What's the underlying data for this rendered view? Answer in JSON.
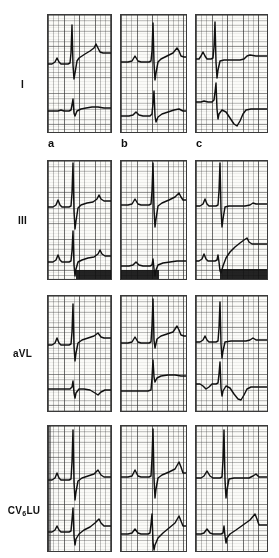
{
  "figure": {
    "type": "ecg-strip-grid",
    "rows": 4,
    "columns": 3,
    "background_color": "#ffffff",
    "trace_color": "#101010",
    "grid_color": "#4a4a4a",
    "paper_color": "#fbfbf8"
  },
  "row_labels": [
    {
      "id": "lead-I",
      "text": "I",
      "sub": ""
    },
    {
      "id": "lead-III",
      "text": "III",
      "sub": ""
    },
    {
      "id": "lead-aVL",
      "text": "aVL",
      "sub": ""
    },
    {
      "id": "lead-CV6LU",
      "text": "CV",
      "sub": "6",
      "suffix": "LU"
    }
  ],
  "column_letters": [
    {
      "id": "col-a",
      "text": "a"
    },
    {
      "id": "col-b",
      "text": "b"
    },
    {
      "id": "col-c",
      "text": "c"
    }
  ],
  "panels": [
    {
      "id": "panel-I-a",
      "lead": "I",
      "column": "a",
      "traces": 2,
      "features": "upper trace: small P wave, tall narrow R wave with deep S, rising ST-T; lower trace: low amplitude baseline with small R wave"
    },
    {
      "id": "panel-I-b",
      "lead": "I",
      "column": "b",
      "traces": 2,
      "features": "upper trace: P wave, tall R, deep S, elevated ST with T wave; lower trace: small complexes with R wave and sloped T"
    },
    {
      "id": "panel-I-c",
      "lead": "I",
      "column": "c",
      "traces": 2,
      "features": "upper trace: P wave, very tall R with deep S, flattened ST; lower trace: deep negative deflection followed by deep negative T wave"
    },
    {
      "id": "panel-III-a",
      "lead": "III",
      "column": "a",
      "traces": 2,
      "dark_band": true,
      "features": "upper trace: P wave, tall R, deep S, rising ST; lower trace: P wave, QRS with deep S, rising ST-T"
    },
    {
      "id": "panel-III-b",
      "lead": "III",
      "column": "b",
      "traces": 2,
      "dark_band": true,
      "features": "upper trace: P wave, tall narrow R, deep S, ascending ST-T; lower trace: small QRS with rising baseline"
    },
    {
      "id": "panel-III-c",
      "lead": "III",
      "column": "c",
      "traces": 2,
      "dark_band": true,
      "features": "upper trace: P wave, tall R, deep S, flat ST; lower trace: P wave, deep S with markedly elevated rising ST segment"
    },
    {
      "id": "panel-aVL-a",
      "lead": "aVL",
      "column": "a",
      "traces": 2,
      "features": "upper trace: P wave, tall narrow R with deep S, ST-T rising to T wave; lower trace: flat baseline with small biphasic QRS and shallow negative T"
    },
    {
      "id": "panel-aVL-b",
      "lead": "aVL",
      "column": "b",
      "traces": 2,
      "features": "upper trace: P wave, very tall R truncated, deep S, rising ST to peaked T; lower trace: tall R with elevated plateau"
    },
    {
      "id": "panel-aVL-c",
      "lead": "aVL",
      "column": "c",
      "traces": 2,
      "features": "upper trace: small P, tall narrow R, deep S, flat ST; lower trace: small R, deep S and deep negative T wave"
    },
    {
      "id": "panel-CV6LU-a",
      "lead": "CV6LU",
      "column": "a",
      "traces": 2,
      "features": "upper trace: P wave, very tall narrow R, deep S, ST rising to T wave; lower trace: deep S with rising ST to peaked T"
    },
    {
      "id": "panel-CV6LU-b",
      "lead": "CV6LU",
      "column": "b",
      "traces": 2,
      "features": "upper trace: P wave, tall R, deep S, ascending ST with tall peaked T; lower trace: QRS with steeply rising ST-T"
    },
    {
      "id": "panel-CV6LU-c",
      "lead": "CV6LU",
      "column": "c",
      "traces": 2,
      "features": "upper trace: P wave, tall R, deep S, flat ST; lower trace: small QRS with rising ST to peaked T wave"
    }
  ]
}
